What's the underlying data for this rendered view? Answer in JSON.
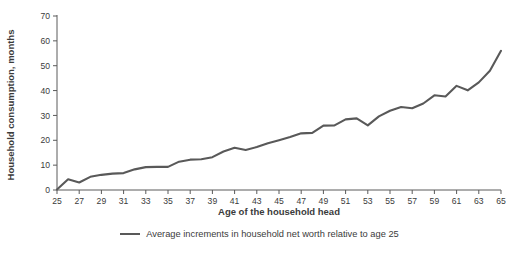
{
  "chart_data": {
    "type": "line",
    "title": "",
    "xlabel": "Age of the household head",
    "ylabel": "Household consumption, months",
    "xlim": [
      25,
      65
    ],
    "ylim": [
      0,
      70
    ],
    "grid": false,
    "legend_position": "bottom",
    "line_color": "#595959",
    "x": [
      25,
      26,
      27,
      28,
      29,
      30,
      31,
      32,
      33,
      34,
      35,
      36,
      37,
      38,
      39,
      40,
      41,
      42,
      43,
      44,
      45,
      46,
      47,
      48,
      49,
      50,
      51,
      52,
      53,
      54,
      55,
      56,
      57,
      58,
      59,
      60,
      61,
      62,
      63,
      64,
      65
    ],
    "series": [
      {
        "name": "Average increments in household net worth relative to age 25",
        "values": [
          0.2,
          4.3,
          3.0,
          5.3,
          6.1,
          6.6,
          6.8,
          8.3,
          9.2,
          9.3,
          9.3,
          11.4,
          12.2,
          12.4,
          13.2,
          15.5,
          17.0,
          16.1,
          17.3,
          18.8,
          20.0,
          21.3,
          22.8,
          23.0,
          25.9,
          26.0,
          28.4,
          28.8,
          26.0,
          29.6,
          31.9,
          33.4,
          32.9,
          34.8,
          38.1,
          37.6,
          41.9,
          40.1,
          43.3,
          48.0,
          56.0
        ]
      }
    ],
    "y_ticks": [
      0,
      10,
      20,
      30,
      40,
      50,
      60,
      70
    ],
    "x_ticks": [
      25,
      27,
      29,
      31,
      33,
      35,
      37,
      39,
      41,
      43,
      45,
      47,
      49,
      51,
      53,
      55,
      57,
      59,
      61,
      63,
      65
    ],
    "legend_entries": [
      "Average increments in household net worth relative to age 25"
    ]
  }
}
